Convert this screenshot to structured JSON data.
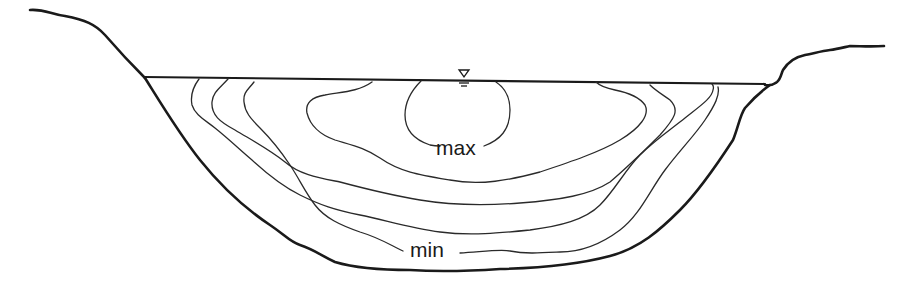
{
  "diagram": {
    "type": "river-channel-cross-section",
    "labels": {
      "max": "max",
      "min": "min"
    },
    "symbols": {
      "water_surface": "water-level-triangle"
    },
    "isovel_count": 5,
    "colors": {
      "line": "#1a1a1a",
      "background": "#ffffff"
    }
  }
}
